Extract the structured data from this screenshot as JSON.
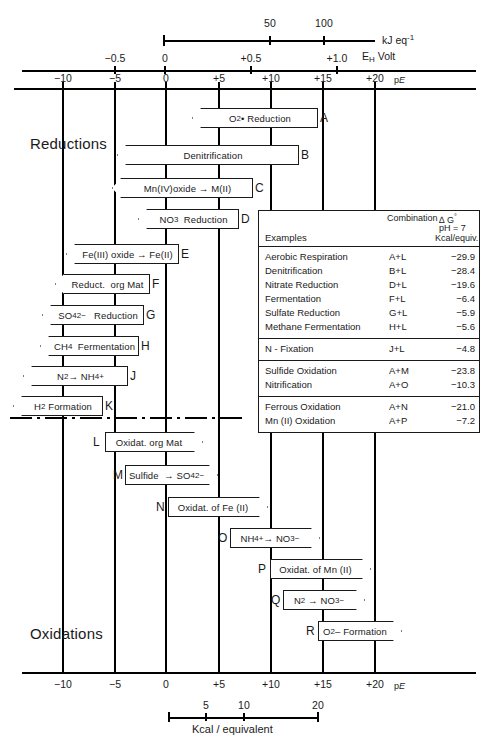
{
  "axes": {
    "kj": {
      "name": "kJ eq",
      "name_sup": "-1",
      "ticks": [
        {
          "label": "50",
          "value": 50
        },
        {
          "label": "100",
          "value": 100
        }
      ]
    },
    "eh": {
      "name": "E",
      "name_sub": "H",
      "name_rest": " Volt",
      "ticks": [
        {
          "label": "−0.5",
          "value": -0.5
        },
        {
          "label": "0",
          "value": 0
        },
        {
          "label": "+0.5",
          "value": 0.5
        },
        {
          "label": "+1.0",
          "value": 1.0
        }
      ]
    },
    "pe": {
      "name": "p",
      "name_italic": "E",
      "ticks": [
        {
          "label": "−10",
          "value": -10
        },
        {
          "label": "−5",
          "value": -5
        },
        {
          "label": "0",
          "value": 0
        },
        {
          "label": "+5",
          "value": 5
        },
        {
          "label": "+10",
          "value": 10
        },
        {
          "label": "+15",
          "value": 15
        },
        {
          "label": "+20",
          "value": 20
        }
      ]
    },
    "pe_bottom": {
      "name": "p",
      "name_italic": "E",
      "ticks": [
        {
          "label": "−10",
          "value": -10
        },
        {
          "label": "−5",
          "value": -5
        },
        {
          "label": "0",
          "value": 0
        },
        {
          "label": "+5",
          "value": 5
        },
        {
          "label": "+10",
          "value": 10
        },
        {
          "label": "+15",
          "value": 15
        },
        {
          "label": "+20",
          "value": 20
        }
      ]
    },
    "kcal": {
      "name": "Kcal / equivalent",
      "ticks": [
        {
          "label": "5",
          "value": 5
        },
        {
          "label": "10",
          "value": 10
        },
        {
          "label": "20",
          "value": 20
        }
      ]
    }
  },
  "captions": {
    "reductions": "Reductions",
    "oxidations": "Oxidations"
  },
  "reactions": [
    {
      "tag": "A",
      "label_html": "O<sub>2</sub> &#8226; Reduction",
      "direction": "left",
      "left": 192,
      "top": 108,
      "width": 126,
      "tag_left": 320,
      "tag_top": 112
    },
    {
      "tag": "B",
      "label_html": "Denitrification",
      "direction": "left",
      "left": 117,
      "top": 145,
      "width": 182,
      "tag_left": 301,
      "tag_top": 149
    },
    {
      "tag": "C",
      "label_html": "Mn(IV)oxide &#8594; M(II)",
      "direction": "left",
      "left": 112,
      "top": 178,
      "width": 141,
      "tag_left": 255,
      "tag_top": 182
    },
    {
      "tag": "D",
      "label_html": "NO<sub>3</sub> &nbsp; Reduction",
      "direction": "left",
      "left": 138,
      "top": 209,
      "width": 101,
      "tag_left": 241,
      "tag_top": 213
    },
    {
      "tag": "E",
      "label_html": "Fe(III) oxide &#8594; Fe(II)",
      "direction": "left",
      "left": 66,
      "top": 244,
      "width": 113,
      "tag_left": 181,
      "tag_top": 248
    },
    {
      "tag": "F",
      "label_html": "Reduct. &nbsp;org Mat",
      "direction": "left",
      "left": 55,
      "top": 274,
      "width": 95,
      "tag_left": 152,
      "tag_top": 278
    },
    {
      "tag": "G",
      "label_html": "SO<sub>4</sub><sup>2−</sup> &nbsp;&nbsp; Reduction",
      "direction": "left",
      "left": 42,
      "top": 305,
      "width": 102,
      "tag_left": 146,
      "tag_top": 309
    },
    {
      "tag": "H",
      "label_html": "CH<sub>4</sub> &nbsp; Fermentation",
      "direction": "left",
      "left": 40,
      "top": 336,
      "width": 99,
      "tag_left": 141,
      "tag_top": 340
    },
    {
      "tag": "J",
      "label_html": "N<sub>2</sub> &#8594; NH<sub>4</sub><sup>+</sup>",
      "direction": "left",
      "left": 23,
      "top": 366,
      "width": 105,
      "tag_left": 130,
      "tag_top": 370
    },
    {
      "tag": "K",
      "label_html": "H<sub>2</sub> &nbsp;Formation",
      "direction": "left",
      "left": 13,
      "top": 396,
      "width": 90,
      "tag_left": 105,
      "tag_top": 400
    },
    {
      "tag": "L",
      "label_html": "Oxidat. org Mat",
      "direction": "right",
      "left": 105,
      "top": 432,
      "width": 98,
      "tag_left": 93,
      "tag_top": 436
    },
    {
      "tag": "M",
      "label_html": "Sulfide &nbsp;&#8594; SO<sub>4</sub><sup>2−</sup>",
      "direction": "right",
      "left": 125,
      "top": 465,
      "width": 93,
      "tag_left": 113,
      "tag_top": 469
    },
    {
      "tag": "N",
      "label_html": "Oxidat. of Fe (II)",
      "direction": "right",
      "left": 168,
      "top": 497,
      "width": 100,
      "tag_left": 156,
      "tag_top": 501
    },
    {
      "tag": "O",
      "label_html": "NH<sub>4</sub><sup>+</sup> &#8594; NO<sub>3</sub><sup>−</sup>",
      "direction": "right",
      "left": 230,
      "top": 528,
      "width": 90,
      "tag_left": 218,
      "tag_top": 532
    },
    {
      "tag": "P",
      "label_html": "Oxidat. of Mn (II)",
      "direction": "right",
      "left": 270,
      "top": 559,
      "width": 101,
      "tag_left": 258,
      "tag_top": 563
    },
    {
      "tag": "Q",
      "label_html": "N<sub>2</sub> &nbsp;&#8594; NO<sub>3</sub><sup>−</sup>",
      "direction": "right",
      "left": 283,
      "top": 590,
      "width": 82,
      "tag_left": 271,
      "tag_top": 594
    },
    {
      "tag": "R",
      "label_html": "O<sub>2</sub> – Formation",
      "direction": "right",
      "left": 318,
      "top": 621,
      "width": 84,
      "tag_left": 306,
      "tag_top": 625
    }
  ],
  "legend": {
    "header": {
      "examples": "Examples",
      "combination": "Combination",
      "delta_g": "∆ G°",
      "ph": "pH = 7",
      "unit": "Kcal/equiv."
    },
    "groups": [
      {
        "rows": [
          {
            "name": "Aerobic Respiration",
            "combination": "A+L",
            "value": "−29.9"
          },
          {
            "name": "Denitrification",
            "combination": "B+L",
            "value": "−28.4"
          },
          {
            "name": "Nitrate Reduction",
            "combination": "D+L",
            "value": "−19.6"
          },
          {
            "name": "Fermentation",
            "combination": "F+L",
            "value": "−6.4"
          },
          {
            "name": "Sulfate Reduction",
            "combination": "G+L",
            "value": "−5.9"
          },
          {
            "name": "Methane Fermentation",
            "combination": "H+L",
            "value": "−5.6"
          }
        ]
      },
      {
        "rows": [
          {
            "name": "N - Fixation",
            "combination": "J+L",
            "value": "−4.8"
          }
        ]
      },
      {
        "rows": [
          {
            "name": "Sulfide Oxidation",
            "combination": "A+M",
            "value": "−23.8"
          },
          {
            "name": "Nitrification",
            "combination": "A+O",
            "value": "−10.3"
          }
        ]
      },
      {
        "rows": [
          {
            "name": "Ferrous Oxidation",
            "combination": "A+N",
            "value": "−21.0"
          },
          {
            "name": "Mn (II) Oxidation",
            "combination": "A+P",
            "value": "−7.2"
          }
        ]
      }
    ]
  },
  "colors": {
    "ink": "#1a1a1a",
    "paper": "#ffffff"
  }
}
